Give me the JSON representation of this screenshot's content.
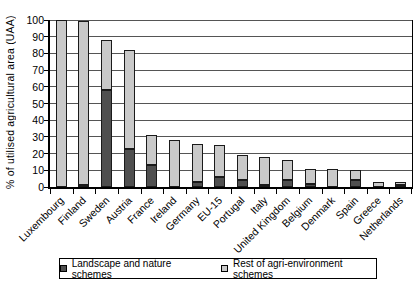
{
  "chart_data": {
    "type": "bar",
    "stacked": true,
    "title": "",
    "xlabel": "",
    "ylabel": "% of utilised agricultural area (UAA)",
    "ylim": [
      0,
      100
    ],
    "yticks": [
      0,
      10,
      20,
      30,
      40,
      50,
      60,
      70,
      80,
      90,
      100
    ],
    "grid": "horizontal",
    "legend_position": "bottom",
    "categories": [
      "Luxembourg",
      "Finland",
      "Sweden",
      "Austria",
      "France",
      "Ireland",
      "Germany",
      "EU-15",
      "Portugal",
      "Italy",
      "United Kingdom",
      "Belgium",
      "Denmark",
      "Spain",
      "Greece",
      "Netherlands"
    ],
    "series": [
      {
        "name": "Landscape and nature schemes",
        "color": "#4f4f4f",
        "values": [
          0,
          1,
          58,
          23,
          13,
          0,
          3,
          6,
          4,
          1,
          4,
          2,
          0,
          4,
          0,
          1
        ]
      },
      {
        "name": "Rest of agri-environment schemes",
        "color": "#c9c9c9",
        "values": [
          100,
          98,
          30,
          59,
          18,
          28,
          23,
          19,
          15,
          17,
          12,
          9,
          11,
          6,
          3,
          2
        ]
      }
    ]
  },
  "colors": {
    "bar_border": "#1a1a1a",
    "grid": "#555555",
    "axis": "#000000",
    "background": "#ffffff",
    "text": "#111111"
  }
}
